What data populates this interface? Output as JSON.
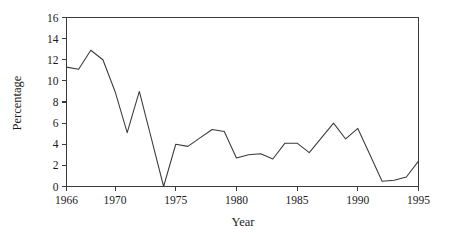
{
  "chart_data": {
    "type": "line",
    "title": "",
    "xlabel": "Year",
    "ylabel": "Percentage",
    "xlim": [
      1966,
      1995
    ],
    "ylim": [
      0,
      16
    ],
    "grid": false,
    "legend": false,
    "xticks": [
      1966,
      1970,
      1975,
      1980,
      1985,
      1990,
      1995
    ],
    "xtick_labels": [
      "1966",
      "1970",
      "1975",
      "1980",
      "1985",
      "1990",
      "1995"
    ],
    "yticks": [
      0,
      2,
      4,
      6,
      8,
      10,
      12,
      14,
      16
    ],
    "ytick_labels": [
      "0",
      "2",
      "4",
      "6",
      "8",
      "10",
      "12",
      "14",
      "16"
    ],
    "x": [
      1966,
      1967,
      1968,
      1969,
      1970,
      1971,
      1972,
      1973,
      1974,
      1975,
      1976,
      1977,
      1978,
      1979,
      1980,
      1981,
      1982,
      1983,
      1984,
      1985,
      1986,
      1987,
      1988,
      1989,
      1990,
      1991,
      1992,
      1993,
      1994,
      1995
    ],
    "values": [
      11.3,
      11.1,
      12.9,
      12.0,
      9.0,
      5.1,
      9.0,
      4.5,
      0.0,
      4.0,
      3.8,
      4.6,
      5.4,
      5.2,
      2.7,
      3.0,
      3.1,
      2.6,
      4.1,
      4.1,
      3.2,
      4.6,
      6.0,
      4.5,
      5.5,
      3.0,
      0.5,
      0.6,
      0.9,
      2.4
    ],
    "series_name": "Percentage",
    "line_color": "#39393b"
  },
  "axes": {
    "x_title": "Year",
    "y_title": "Percentage"
  }
}
